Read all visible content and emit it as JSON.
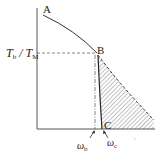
{
  "diagram": {
    "type": "torque-speed characteristic",
    "points": {
      "A": "A",
      "B": "B",
      "C": "C"
    },
    "y_label": {
      "T1": "T",
      "sub1": "b",
      "slash": " / ",
      "T2": "T",
      "sub2": "M"
    },
    "x_labels": {
      "omega_b": {
        "sym": "ω",
        "sub": "b"
      },
      "omega_c": {
        "sym": "ω",
        "sub": "c"
      }
    },
    "colors": {
      "line": "#333333",
      "hatch": "#555555"
    }
  }
}
